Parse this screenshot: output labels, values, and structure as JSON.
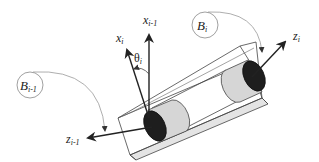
{
  "diagram": {
    "title": "",
    "labels": {
      "x_prev": {
        "base": "x",
        "sub": "i-1"
      },
      "x_curr": {
        "base": "x",
        "sub": "i"
      },
      "theta": {
        "base": "θ",
        "sub": "i"
      },
      "z_curr": {
        "base": "z",
        "sub": "i"
      },
      "z_prev": {
        "base": "z",
        "sub": "i-1"
      },
      "body_curr": {
        "base": "B",
        "sub": "i"
      },
      "body_prev": {
        "base": "B",
        "sub": "i-1"
      }
    },
    "colors": {
      "line": "#222222",
      "thin_line": "#777777",
      "cylinder_fill": "#d6d6d6",
      "cap_fill": "#1e1e1e",
      "box_bottom_fill": "#e4e4e4",
      "background": "#ffffff"
    }
  }
}
